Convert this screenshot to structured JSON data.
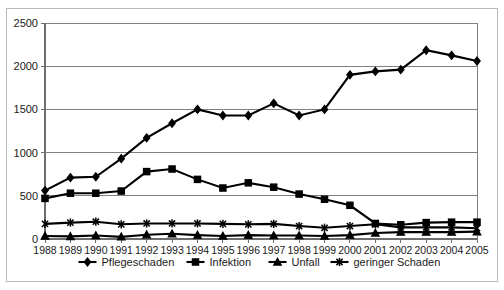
{
  "chart_data": {
    "type": "line",
    "title": "",
    "subtitle": "",
    "xlabel": "",
    "ylabel": "",
    "categories": [
      "1988",
      "1989",
      "1990",
      "1991",
      "1992",
      "1993",
      "1994",
      "1995",
      "1996",
      "1997",
      "1998",
      "1999",
      "2000",
      "2001",
      "2002",
      "2003",
      "2004",
      "2005"
    ],
    "ylim": [
      0,
      2500
    ],
    "yticks": [
      0,
      500,
      1000,
      1500,
      2000,
      2500
    ],
    "ytick_labels": [
      "0",
      "500",
      "1000",
      "1500",
      "2000",
      "2500"
    ],
    "grid": "horizontal",
    "legend_position": "bottom",
    "series": [
      {
        "name": "Pflegeschaden",
        "marker": "diamond",
        "color": "#000000",
        "values": [
          560,
          710,
          720,
          930,
          1170,
          1340,
          1500,
          1430,
          1430,
          1570,
          1430,
          1500,
          1900,
          1940,
          1960,
          2185,
          2125,
          2060
        ]
      },
      {
        "name": "Infektion",
        "marker": "square",
        "color": "#000000",
        "values": [
          470,
          530,
          530,
          555,
          780,
          810,
          690,
          590,
          650,
          600,
          520,
          460,
          390,
          180,
          165,
          190,
          195,
          195
        ]
      },
      {
        "name": "Unfall",
        "marker": "triangle",
        "color": "#000000",
        "values": [
          35,
          30,
          40,
          25,
          50,
          60,
          45,
          35,
          45,
          40,
          40,
          35,
          45,
          70,
          80,
          80,
          80,
          85
        ]
      },
      {
        "name": "geringer Schaden",
        "marker": "x",
        "color": "#000000",
        "values": [
          175,
          190,
          200,
          170,
          180,
          180,
          180,
          175,
          170,
          175,
          150,
          130,
          150,
          170,
          135,
          135,
          135,
          125
        ]
      }
    ]
  },
  "axes": {
    "y_ticks": [
      "2500",
      "2000",
      "1500",
      "1000",
      "500",
      "0"
    ],
    "x_ticks": [
      "1988",
      "1989",
      "1990",
      "1991",
      "1992",
      "1993",
      "1994",
      "1995",
      "1996",
      "1997",
      "1998",
      "1999",
      "2000",
      "2001",
      "2002",
      "2003",
      "2004",
      "2005"
    ]
  },
  "legend": {
    "items": [
      {
        "label": "Pflegeschaden",
        "marker": "diamond-marker"
      },
      {
        "label": "Infektion",
        "marker": "square-marker"
      },
      {
        "label": "Unfall",
        "marker": "triangle-marker"
      },
      {
        "label": "geringer Schaden",
        "marker": "x-marker"
      }
    ]
  },
  "colors": {
    "series": "#000000",
    "gridline": "#808080",
    "border": "#b9b9b9",
    "background": "#ffffff"
  }
}
